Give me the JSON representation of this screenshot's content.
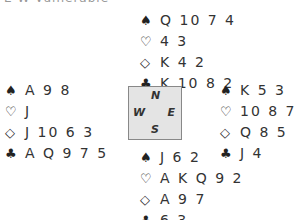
{
  "header": {
    "text": "E-W Vulnerable"
  },
  "icons": {
    "spade": "♠",
    "heart": "♡",
    "diamond": "◇",
    "club": "♣"
  },
  "compass": {
    "north": "N",
    "south": "S",
    "west": "W",
    "east": "E"
  },
  "hands": {
    "north": {
      "spades": "Q 10 7 4",
      "hearts": "4 3",
      "diamonds": "K 4 2",
      "clubs": "K 10 8 2"
    },
    "west": {
      "spades": "A 9 8",
      "hearts": "J",
      "diamonds": "J 10 6 3",
      "clubs": "A Q 9 7 5"
    },
    "east": {
      "spades": "K 5 3",
      "hearts": "10 8 7 6 5",
      "diamonds": "Q 8 5",
      "clubs": "J 4"
    },
    "south": {
      "spades": "J 6 2",
      "hearts": "A K Q 9 2",
      "diamonds": "A 9 7",
      "clubs": "6 3"
    }
  }
}
